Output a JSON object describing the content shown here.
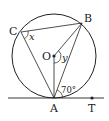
{
  "diagram": {
    "type": "circle-geometry",
    "colors": {
      "stroke": "#222222",
      "background": "#ffffff"
    },
    "circle": {
      "center_label": "O"
    },
    "points": {
      "A": "A",
      "B": "B",
      "C": "C",
      "O": "O",
      "T": "T"
    },
    "angles": {
      "x_label": "x",
      "y_label": "y",
      "given_angle": "70°"
    },
    "segments": [
      "CB",
      "CA",
      "BA",
      "OB",
      "OA",
      "tangent AT"
    ]
  }
}
